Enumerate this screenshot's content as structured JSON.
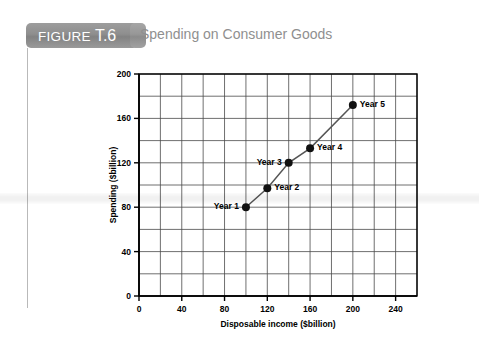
{
  "header": {
    "figure_word": "FIGURE",
    "figure_number": "T.6",
    "title": "Spending on Consumer Goods"
  },
  "chart_data": {
    "type": "line",
    "title": "Spending on Consumer Goods",
    "xlabel": "Disposable income ($billion)",
    "ylabel": "Spending ($billion)",
    "xlim": [
      0,
      260
    ],
    "ylim": [
      0,
      200
    ],
    "xticks": [
      0,
      40,
      80,
      120,
      160,
      200,
      240
    ],
    "yticks": [
      0,
      40,
      80,
      120,
      160,
      200
    ],
    "grid": true,
    "grid_step_x": 20,
    "grid_step_y": 20,
    "legend": "none",
    "series": [
      {
        "name": "Consumption function",
        "x": [
          100,
          120,
          140,
          160,
          200
        ],
        "y": [
          80,
          97,
          120,
          133,
          172
        ],
        "labels": [
          "Year 1",
          "Year 2",
          "Year 3",
          "Year 4",
          "Year 5"
        ],
        "label_side": [
          "left",
          "right",
          "left",
          "right",
          "right"
        ]
      }
    ]
  }
}
